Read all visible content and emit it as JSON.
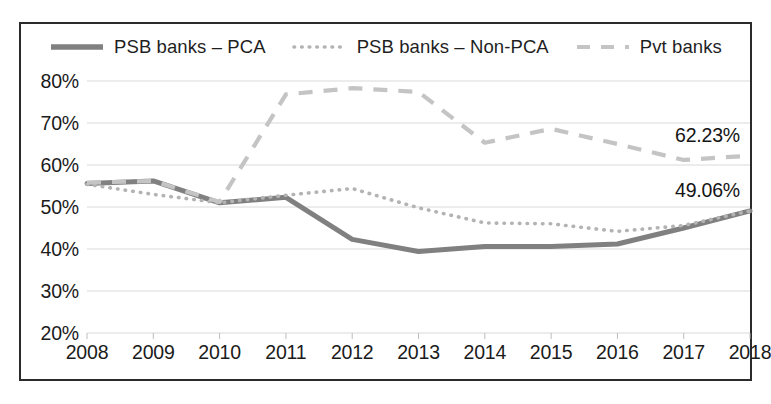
{
  "chart_data": {
    "type": "line",
    "title": "",
    "xlabel": "",
    "ylabel": "",
    "grid": true,
    "legend_position": "top",
    "ylim": [
      20,
      80
    ],
    "ytick_step": 10,
    "ytick_labels": [
      "80%",
      "70%",
      "60%",
      "50%",
      "40%",
      "30%",
      "20%"
    ],
    "ytick_values": [
      80,
      70,
      60,
      50,
      40,
      30,
      20
    ],
    "categories": [
      "2008",
      "2009",
      "2010",
      "2011",
      "2012",
      "2013",
      "2014",
      "2015",
      "2016",
      "2017",
      "2018"
    ],
    "x": [
      2008,
      2009,
      2010,
      2011,
      2012,
      2013,
      2014,
      2015,
      2016,
      2017,
      2018
    ],
    "series": [
      {
        "name": "PSB banks – PCA",
        "style": "solid",
        "color": "#808080",
        "width": 5.0,
        "values": [
          55.6,
          56.2,
          51.0,
          52.3,
          42.3,
          39.4,
          40.6,
          40.6,
          41.2,
          45.0,
          49.06
        ]
      },
      {
        "name": "PSB banks – Non-PCA",
        "style": "dotted",
        "color": "#b3b3b3",
        "width": 3.6,
        "values": [
          55.4,
          53.0,
          51.0,
          52.8,
          54.4,
          49.8,
          46.2,
          46.0,
          44.2,
          45.6,
          49.06
        ]
      },
      {
        "name": "Pvt banks",
        "style": "dashed",
        "color": "#c4c4c4",
        "width": 4.2,
        "values": [
          55.8,
          56.2,
          51.2,
          76.8,
          78.3,
          77.4,
          65.3,
          68.6,
          65.0,
          61.2,
          62.23
        ]
      }
    ],
    "annotations": [
      {
        "text": "62.23%",
        "series": "Pvt banks",
        "x": "2018",
        "value": 62.23
      },
      {
        "text": "49.06%",
        "series": "PSB banks – PCA",
        "x": "2018",
        "value": 49.06
      }
    ]
  },
  "legend": {
    "items": [
      {
        "label": "PSB banks – PCA"
      },
      {
        "label": "PSB banks – Non-PCA"
      },
      {
        "label": "Pvt banks"
      }
    ]
  },
  "colors": {
    "pca": "#808080",
    "non_pca": "#b3b3b3",
    "pvt": "#c4c4c4",
    "grid": "#d9d9d9",
    "border": "#2b2b2b",
    "text": "#1b1b1b"
  }
}
